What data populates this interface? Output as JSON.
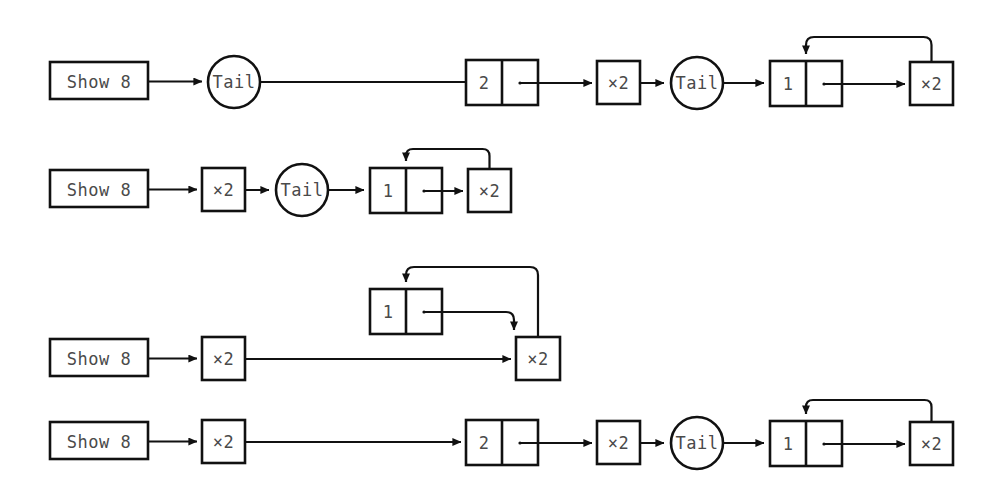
{
  "diagram": {
    "type": "graph-reduction-diagram",
    "colors": {
      "stroke": "#111111",
      "background": "#ffffff",
      "label": "#4a4a4a"
    },
    "labels": {
      "show8": "Show 8",
      "tail": "Tail",
      "times2": "×2",
      "value_2": "2",
      "value_1": "1"
    },
    "rows": [
      {
        "index": 1,
        "nodes": [
          {
            "id": "r1-show8",
            "kind": "box",
            "label": "Show 8"
          },
          {
            "id": "r1-tail1",
            "kind": "circle",
            "label": "Tail"
          },
          {
            "id": "r1-cons2",
            "kind": "cons-cell",
            "label": "2"
          },
          {
            "id": "r1-times2a",
            "kind": "box",
            "label": "×2"
          },
          {
            "id": "r1-tail2",
            "kind": "circle",
            "label": "Tail"
          },
          {
            "id": "r1-cons1",
            "kind": "cons-cell",
            "label": "1"
          },
          {
            "id": "r1-times2b",
            "kind": "box",
            "label": "×2"
          }
        ],
        "has_cycle": true
      },
      {
        "index": 2,
        "nodes": [
          {
            "id": "r2-show8",
            "kind": "box",
            "label": "Show 8"
          },
          {
            "id": "r2-times2a",
            "kind": "box",
            "label": "×2"
          },
          {
            "id": "r2-tail",
            "kind": "circle",
            "label": "Tail"
          },
          {
            "id": "r2-cons1",
            "kind": "cons-cell",
            "label": "1"
          },
          {
            "id": "r2-times2b",
            "kind": "box",
            "label": "×2"
          }
        ],
        "has_cycle": true
      },
      {
        "index": 3,
        "nodes": [
          {
            "id": "r3-show8",
            "kind": "box",
            "label": "Show 8"
          },
          {
            "id": "r3-times2a",
            "kind": "box",
            "label": "×2"
          },
          {
            "id": "r3-cons1",
            "kind": "cons-cell",
            "label": "1"
          },
          {
            "id": "r3-times2b",
            "kind": "box",
            "label": "×2"
          }
        ],
        "has_cycle": true
      },
      {
        "index": 4,
        "nodes": [
          {
            "id": "r4-show8",
            "kind": "box",
            "label": "Show 8"
          },
          {
            "id": "r4-times2a",
            "kind": "box",
            "label": "×2"
          },
          {
            "id": "r4-cons2",
            "kind": "cons-cell",
            "label": "2"
          },
          {
            "id": "r4-times2b",
            "kind": "box",
            "label": "×2"
          },
          {
            "id": "r4-tail",
            "kind": "circle",
            "label": "Tail"
          },
          {
            "id": "r4-cons1",
            "kind": "cons-cell",
            "label": "1"
          },
          {
            "id": "r4-times2c",
            "kind": "box",
            "label": "×2"
          }
        ],
        "has_cycle": true
      }
    ]
  }
}
